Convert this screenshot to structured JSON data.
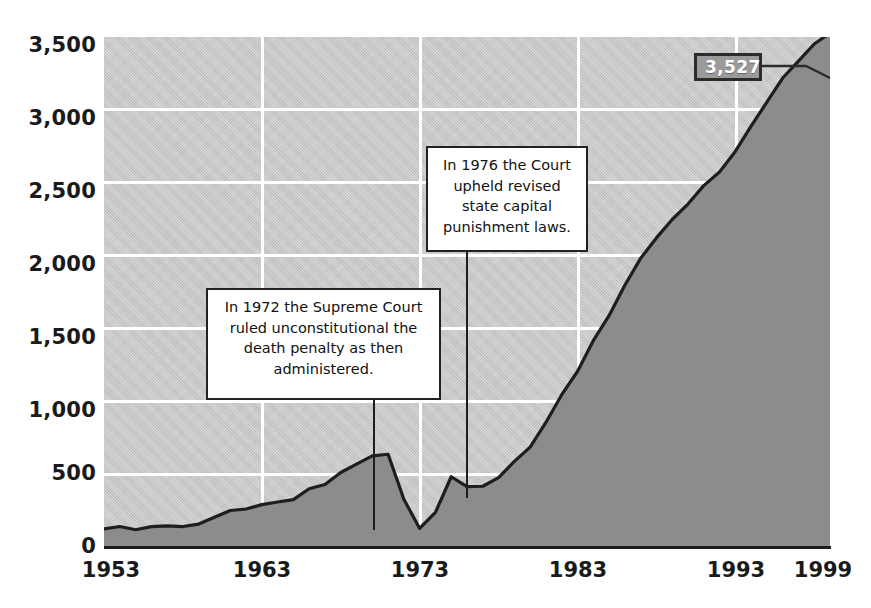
{
  "chart_data": {
    "type": "area",
    "title": "",
    "subtitle": "",
    "xlabel": "",
    "ylabel": "",
    "xlim": [
      1953,
      1999
    ],
    "ylim": [
      0,
      3500
    ],
    "grid": true,
    "legend_position": "none",
    "y_ticks": [
      "3,500",
      "3,000",
      "2,500",
      "2,000",
      "1,500",
      "1,000",
      "500",
      "0"
    ],
    "y_tick_values": [
      3500,
      3000,
      2500,
      2000,
      1500,
      1000,
      500,
      0
    ],
    "x_ticks": [
      "1953",
      "1963",
      "1973",
      "1983",
      "1993",
      "1999"
    ],
    "x_tick_values": [
      1953,
      1963,
      1973,
      1983,
      1993,
      1999
    ],
    "series": [
      {
        "name": "Prisoners under sentence of death",
        "x": [
          1953,
          1954,
          1955,
          1956,
          1957,
          1958,
          1959,
          1960,
          1961,
          1962,
          1963,
          1964,
          1965,
          1966,
          1967,
          1968,
          1969,
          1970,
          1971,
          1972,
          1973,
          1974,
          1975,
          1976,
          1977,
          1978,
          1979,
          1980,
          1981,
          1982,
          1983,
          1984,
          1985,
          1986,
          1987,
          1988,
          1989,
          1990,
          1991,
          1992,
          1993,
          1994,
          1995,
          1996,
          1997,
          1998,
          1999
        ],
        "values": [
          131,
          147,
          125,
          146,
          151,
          147,
          164,
          210,
          257,
          267,
          297,
          315,
          331,
          406,
          435,
          517,
          575,
          631,
          642,
          334,
          134,
          244,
          488,
          420,
          423,
          482,
          593,
          691,
          860,
          1050,
          1209,
          1420,
          1591,
          1800,
          1984,
          2124,
          2250,
          2356,
          2482,
          2575,
          2716,
          2890,
          3054,
          3219,
          3335,
          3452,
          3527
        ]
      }
    ],
    "data_labels": [
      {
        "name": "end-value",
        "text": "3,527",
        "x": 1999,
        "y": 3527
      }
    ],
    "annotations": [
      {
        "name": "annotation-1972",
        "text": "In 1972 the Supreme Court ruled unconstitutional the death penalty as then administered.",
        "anchor_x": 1972,
        "anchor_y": 334
      },
      {
        "name": "annotation-1976",
        "text": "In 1976 the Court upheld revised state capital punishment laws.",
        "anchor_x": 1976,
        "anchor_y": 420
      }
    ],
    "colors": {
      "plot_background": "#c6c6c6",
      "area_fill": "#8c8c8c",
      "line": "#1e1e1e",
      "gridline": "#ffffff",
      "axis": "#1c1c1c",
      "text": "#1a1a1a",
      "callout_background": "#ffffff",
      "callout_border": "#222222",
      "value_label_background": "#9a9a9a",
      "value_label_border": "#2b2b2b",
      "value_label_text": "#ffffff"
    }
  }
}
